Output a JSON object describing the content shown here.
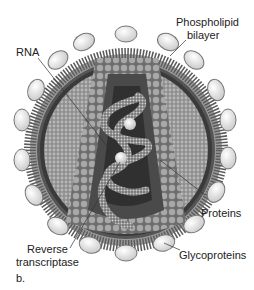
{
  "figure": {
    "panel_label": "b.",
    "labels": {
      "phospholipid_line1": "Phospholipid",
      "phospholipid_line2": "bilayer",
      "rna": "RNA",
      "proteins": "Proteins",
      "reverse_line1": "Reverse",
      "reverse_line2": "transcriptase",
      "glycoproteins": "Glycoproteins"
    },
    "colors": {
      "membrane": "#8a8a8a",
      "inner_ring": "#3a3a3a",
      "matrix": "#9a9a9a",
      "core": "#555555",
      "glycoprotein_fill": "#e8e8e8",
      "glycoprotein_stroke": "#777777"
    }
  }
}
